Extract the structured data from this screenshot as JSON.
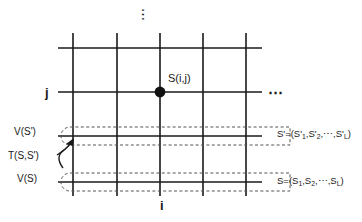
{
  "figure": {
    "background_color": "#ffffff",
    "line_color": "#1a1a1a",
    "dash_color": "#555555"
  },
  "axes": {
    "horizontal_label": "i",
    "vertical_label": "j"
  },
  "node": {
    "label": "S(i,j)",
    "marker": "filled-circle",
    "x": 160,
    "y": 92
  },
  "ellipsis": {
    "vertical": "⋮",
    "horizontal": "⋯"
  },
  "bands": {
    "upper": {
      "left_label": "V(S')",
      "right_label_prefix": "S'=(S'",
      "right_label": "S'=(S'1,S'2,⋯,S'L)",
      "parts": {
        "head": "S'=(S'",
        "sub1": "1",
        "mid1": ",S'",
        "sub2": "2",
        "mid2": ",⋯,S'",
        "sub3": "L",
        "tail": ")"
      }
    },
    "lower": {
      "left_label": "V(S)",
      "right_label": "S=(S1,S2,⋯,SL)",
      "parts": {
        "head": "S=(S",
        "sub1": "1",
        "mid1": ",S",
        "sub2": "2",
        "mid2": ",⋯,S",
        "sub3": "L",
        "tail": ")"
      }
    }
  },
  "transition": {
    "label": "T(S,S')",
    "arrow": "curved-arrow-up-right"
  },
  "grid": {
    "vertical_lines_x": [
      73,
      117,
      160,
      203,
      246
    ],
    "horizontal_lines_y": [
      48,
      92,
      136,
      182
    ],
    "line_x_start": 58,
    "line_x_end": 262,
    "line_y_start": 33,
    "line_y_end": 196
  }
}
